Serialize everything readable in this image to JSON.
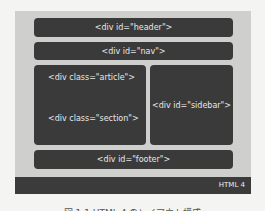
{
  "diagram": {
    "boxes": {
      "header": "<div id=\"header\">",
      "nav": "<div id=\"nav\">",
      "article": "<div class=\"article\">",
      "section": "<div class=\"section\">",
      "sidebar": "<div id=\"sidebar\">",
      "footer": "<div id=\"footer\">"
    },
    "version_label": "HTML 4",
    "caption": "図 1.1 HTML 4 のレイアウト構成"
  },
  "colors": {
    "box": "#3a3a3a",
    "panel": "#cfcfcd",
    "bar": "#3b3b3b",
    "background": "#f4f4f2"
  }
}
